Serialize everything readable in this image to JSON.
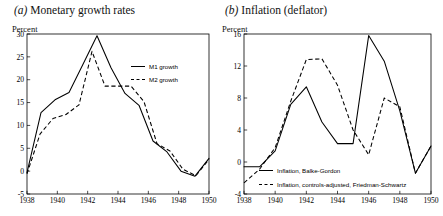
{
  "figure": {
    "panels": [
      {
        "id": "panel-a",
        "label": "(a)",
        "title": "Monetary growth rates",
        "axis_unit": "Percent"
      },
      {
        "id": "panel-b",
        "label": "(b)",
        "title": "Inflation (deflator)",
        "axis_unit": "Percent"
      }
    ]
  },
  "chart_data": [
    {
      "type": "line",
      "title": "(a) Monetary growth rates",
      "xlabel": "",
      "ylabel": "Percent",
      "xlim": [
        1938,
        1950
      ],
      "ylim": [
        -5,
        30
      ],
      "yticks": [
        -5,
        0,
        5,
        10,
        15,
        20,
        25,
        30
      ],
      "xticks": [
        1938,
        1940,
        1942,
        1944,
        1946,
        1948,
        1950
      ],
      "grid": false,
      "legend_position": "inside-upper-right",
      "x": [
        1938,
        1939,
        1940,
        1941,
        1942,
        1943,
        1944,
        1945,
        1946,
        1947,
        1948,
        1949,
        1950
      ],
      "series": [
        {
          "name": "M1 growth",
          "style": "solid",
          "values": [
            -0.3,
            12.8,
            15.6,
            17.2,
            23.4,
            29.6,
            22.6,
            17.0,
            14.4,
            6.6,
            4.2,
            0.0,
            -1.1,
            2.8
          ]
        },
        {
          "name": "M2 growth",
          "style": "dashed",
          "values": [
            -0.6,
            8.1,
            11.5,
            12.4,
            14.5,
            26.2,
            18.6,
            18.6,
            18.6,
            15.2,
            6.0,
            4.4,
            0.4,
            -1.0,
            2.6
          ]
        }
      ]
    },
    {
      "type": "line",
      "title": "(b) Inflation (deflator)",
      "xlabel": "",
      "ylabel": "Percent",
      "xlim": [
        1938,
        1950
      ],
      "ylim": [
        -4,
        16
      ],
      "yticks": [
        -4,
        0,
        4,
        8,
        12,
        16
      ],
      "xticks": [
        1938,
        1940,
        1942,
        1944,
        1946,
        1948,
        1950
      ],
      "grid": false,
      "legend_position": "inside-lower-center",
      "x": [
        1938,
        1939,
        1940,
        1941,
        1942,
        1943,
        1944,
        1945,
        1946,
        1947,
        1948,
        1949,
        1950
      ],
      "series": [
        {
          "name": "Inflation, Balke-Gordon",
          "style": "solid",
          "values": [
            -0.6,
            -0.6,
            1.4,
            7.2,
            9.4,
            5.0,
            2.3,
            2.3,
            15.8,
            12.6,
            6.4,
            -1.4,
            2.0
          ]
        },
        {
          "name": "Inflation, controls-adjusted, Friedman-Schwartz",
          "style": "dashed",
          "values": [
            -2.6,
            -0.9,
            1.8,
            7.6,
            12.8,
            12.9,
            9.6,
            4.0,
            0.9,
            8.0,
            6.9,
            -1.4,
            2.0
          ]
        }
      ]
    }
  ],
  "legends": {
    "panel_a": [
      {
        "label": "M1 growth",
        "style": "solid"
      },
      {
        "label": "M2 growth",
        "style": "dashed"
      }
    ],
    "panel_b": [
      {
        "label": "Inflation, Balke-Gordon",
        "style": "solid"
      },
      {
        "label": "Inflation, controls-adjusted, Friedman-Schwartz",
        "style": "dashed"
      }
    ]
  }
}
